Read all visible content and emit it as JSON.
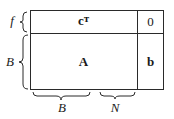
{
  "diagram": {
    "cells": {
      "top_left": "cᵀ",
      "top_right": "0",
      "bottom_left": "A",
      "bottom_right": "b"
    },
    "row_labels": {
      "top": "f",
      "bottom": "B"
    },
    "column_labels": {
      "left": "B",
      "right": "N"
    }
  }
}
